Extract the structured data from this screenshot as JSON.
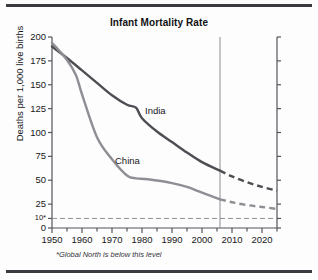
{
  "chart_data": {
    "type": "line",
    "title": "Infant Mortality Rate",
    "xlabel": "",
    "ylabel": "Deaths per 1,000 live births",
    "xlim": [
      1950,
      2025
    ],
    "ylim": [
      0,
      200
    ],
    "grid": false,
    "legend_position": "inline-labels",
    "x_ticks": [
      1950,
      1960,
      1970,
      1980,
      1990,
      2000,
      2010,
      2020
    ],
    "x_tick_labels": [
      "1950",
      "1960",
      "1970",
      "1980",
      "1990",
      "2000",
      "2010",
      "2020"
    ],
    "x_minor_tick_step": 5,
    "y_ticks": [
      0,
      10,
      25,
      50,
      75,
      100,
      125,
      150,
      175,
      200
    ],
    "y_tick_labels": [
      "0",
      "10*",
      "25",
      "50",
      "75",
      "100",
      "125",
      "150",
      "175",
      "200"
    ],
    "reference_line": {
      "label": "10*",
      "value": 10,
      "style": "dashed",
      "note": "*Global North is below this level"
    },
    "projection_divider_year": 2006,
    "annotations": [
      {
        "text": "India",
        "x": 1981,
        "y": 122
      },
      {
        "text": "China",
        "x": 1971,
        "y": 70
      }
    ],
    "series": [
      {
        "name": "India",
        "color": "#4d4d53",
        "observed": [
          {
            "x": 1950,
            "y": 190
          },
          {
            "x": 1955,
            "y": 178
          },
          {
            "x": 1960,
            "y": 165
          },
          {
            "x": 1965,
            "y": 152
          },
          {
            "x": 1970,
            "y": 139
          },
          {
            "x": 1975,
            "y": 129
          },
          {
            "x": 1978,
            "y": 126
          },
          {
            "x": 1980,
            "y": 115
          },
          {
            "x": 1985,
            "y": 101
          },
          {
            "x": 1990,
            "y": 90
          },
          {
            "x": 1995,
            "y": 79
          },
          {
            "x": 2000,
            "y": 69
          },
          {
            "x": 2006,
            "y": 60
          }
        ],
        "projected": [
          {
            "x": 2006,
            "y": 60
          },
          {
            "x": 2010,
            "y": 54
          },
          {
            "x": 2015,
            "y": 48
          },
          {
            "x": 2020,
            "y": 43
          },
          {
            "x": 2025,
            "y": 39
          }
        ]
      },
      {
        "name": "China",
        "color": "#8e8e95",
        "observed": [
          {
            "x": 1950,
            "y": 194
          },
          {
            "x": 1955,
            "y": 176
          },
          {
            "x": 1958,
            "y": 160
          },
          {
            "x": 1960,
            "y": 140
          },
          {
            "x": 1965,
            "y": 95
          },
          {
            "x": 1970,
            "y": 72
          },
          {
            "x": 1975,
            "y": 55
          },
          {
            "x": 1978,
            "y": 52
          },
          {
            "x": 1982,
            "y": 51
          },
          {
            "x": 1990,
            "y": 47
          },
          {
            "x": 1995,
            "y": 43
          },
          {
            "x": 2000,
            "y": 37
          },
          {
            "x": 2006,
            "y": 30
          }
        ],
        "projected": [
          {
            "x": 2006,
            "y": 30
          },
          {
            "x": 2010,
            "y": 27
          },
          {
            "x": 2015,
            "y": 24
          },
          {
            "x": 2020,
            "y": 22
          },
          {
            "x": 2025,
            "y": 20
          }
        ]
      }
    ]
  },
  "footnote": "*Global North is below this level"
}
